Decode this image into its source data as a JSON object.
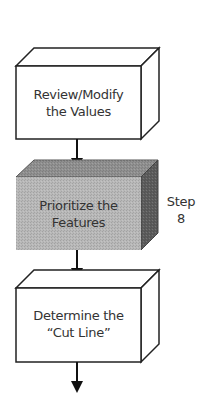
{
  "diagram": {
    "type": "flowchart",
    "steps": [
      {
        "label_line1": "Review/Modify",
        "label_line2": "the Values",
        "highlighted": false,
        "fill": "#ffffff"
      },
      {
        "label_line1": "Prioritize the",
        "label_line2": "Features",
        "highlighted": true,
        "fill": "#b8b8b8"
      },
      {
        "label_line1": "Determine the",
        "label_line2": "“Cut Line”",
        "highlighted": false,
        "fill": "#ffffff"
      }
    ],
    "annotation": {
      "line1": "Step",
      "line2": "8"
    },
    "colors": {
      "stroke": "#222222",
      "highlight_front": "#b8b8b8",
      "highlight_top": "#8f8f8f",
      "highlight_side": "#5c5c5c"
    }
  }
}
